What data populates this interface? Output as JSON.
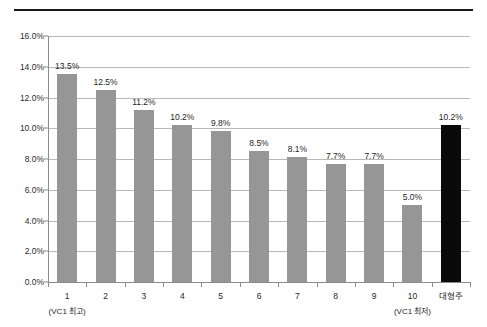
{
  "page": {
    "cut_off_heading": "— —— ——  —————"
  },
  "chart_data": {
    "type": "bar",
    "title": "",
    "subtitle": "",
    "xlabel": "",
    "ylabel": "",
    "ylim": [
      0,
      16
    ],
    "ytick_labels": [
      "0.0%",
      "2.0%",
      "4.0%",
      "6.0%",
      "8.0%",
      "10.0%",
      "12.0%",
      "14.0%",
      "16.0%"
    ],
    "ytick_values": [
      0,
      2,
      4,
      6,
      8,
      10,
      12,
      14,
      16
    ],
    "grid": true,
    "legend": "none",
    "categories": [
      "1",
      "2",
      "3",
      "4",
      "5",
      "6",
      "7",
      "8",
      "9",
      "10",
      "대형주"
    ],
    "category_sublabels": [
      "(VC1 최고)",
      "",
      "",
      "",
      "",
      "",
      "",
      "",
      "",
      "(VC1 최저)",
      ""
    ],
    "values": [
      13.5,
      12.5,
      11.2,
      10.2,
      9.8,
      8.5,
      8.1,
      7.7,
      7.7,
      5.0,
      10.2
    ],
    "data_labels": [
      "13.5%",
      "12.5%",
      "11.2%",
      "10.2%",
      "9.8%",
      "8.5%",
      "8.1%",
      "7.7%",
      "7.7%",
      "5.0%",
      "10.2%"
    ],
    "bar_colors": [
      "#969696",
      "#969696",
      "#969696",
      "#969696",
      "#969696",
      "#969696",
      "#969696",
      "#969696",
      "#969696",
      "#969696",
      "#0a0a0a"
    ],
    "highlight_index": 10,
    "colors": {
      "bar_default": "#969696",
      "bar_accent": "#0a0a0a",
      "gridline": "#b9b9b9",
      "axis": "#8c8c8c",
      "text": "#1f1f1f",
      "background": "#ffffff",
      "top_rule": "#1a1a1a"
    }
  }
}
